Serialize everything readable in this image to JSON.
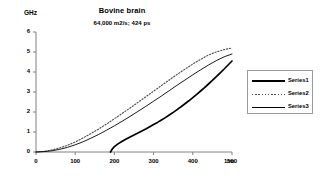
{
  "chart_data": {
    "type": "line",
    "title": "Bovine brain",
    "subtitle": "64,000 m2/s; 424 ps",
    "xlabel": "1/m",
    "ylabel": "GHz",
    "xlim": [
      0,
      500
    ],
    "ylim": [
      0,
      6
    ],
    "xticks": [
      "0",
      "100",
      "200",
      "300",
      "400",
      "500"
    ],
    "yticks": [
      "0",
      "1",
      "2",
      "3",
      "4",
      "5",
      "6"
    ],
    "grid": false,
    "legend_position": "right",
    "series": [
      {
        "name": "Series1",
        "style": "solid-thick",
        "x": [
          190,
          195,
          200,
          210,
          220,
          230,
          240,
          250,
          260,
          270,
          280,
          290,
          300,
          310,
          320,
          330,
          340,
          350,
          360,
          370,
          380,
          390,
          400,
          410,
          420,
          430,
          440,
          450,
          460,
          470,
          480,
          490,
          500
        ],
        "y": [
          0.0,
          0.16,
          0.27,
          0.42,
          0.54,
          0.65,
          0.75,
          0.85,
          0.95,
          1.05,
          1.15,
          1.26,
          1.37,
          1.48,
          1.6,
          1.72,
          1.85,
          1.98,
          2.12,
          2.26,
          2.41,
          2.56,
          2.72,
          2.88,
          3.05,
          3.22,
          3.4,
          3.58,
          3.77,
          3.96,
          4.15,
          4.35,
          4.55
        ]
      },
      {
        "name": "Series2",
        "style": "dotted",
        "x": [
          0,
          20,
          40,
          60,
          80,
          100,
          120,
          140,
          160,
          180,
          200,
          220,
          240,
          260,
          280,
          300,
          320,
          340,
          360,
          380,
          400,
          420,
          440,
          460,
          480,
          500
        ],
        "y": [
          0.0,
          0.03,
          0.1,
          0.2,
          0.33,
          0.5,
          0.7,
          0.92,
          1.15,
          1.4,
          1.66,
          1.93,
          2.2,
          2.48,
          2.76,
          3.04,
          3.32,
          3.6,
          3.88,
          4.14,
          4.4,
          4.63,
          4.85,
          5.0,
          5.12,
          5.2
        ]
      },
      {
        "name": "Series3",
        "style": "solid-thin",
        "x": [
          0,
          20,
          40,
          60,
          80,
          100,
          120,
          140,
          160,
          180,
          200,
          220,
          240,
          260,
          280,
          300,
          320,
          340,
          360,
          380,
          400,
          420,
          440,
          460,
          480,
          500
        ],
        "y": [
          0.0,
          0.02,
          0.06,
          0.13,
          0.23,
          0.36,
          0.51,
          0.69,
          0.88,
          1.09,
          1.31,
          1.54,
          1.78,
          2.03,
          2.28,
          2.54,
          2.8,
          3.07,
          3.34,
          3.6,
          3.86,
          4.11,
          4.35,
          4.57,
          4.76,
          4.9
        ]
      }
    ]
  },
  "legend": {
    "items": [
      {
        "label": "Series1"
      },
      {
        "label": "Series2"
      },
      {
        "label": "Series3"
      }
    ]
  },
  "colors": {
    "axis": "#808080",
    "series1": "#000000",
    "series2": "#4d4d4d",
    "series3": "#000000"
  }
}
